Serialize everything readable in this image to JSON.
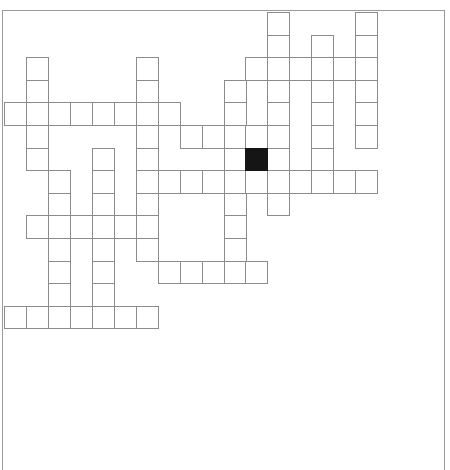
{
  "puzzle": {
    "title": "",
    "grid": {
      "rows": 14,
      "cols": 17,
      "cell_width_px": 21.95,
      "cell_height_px": 22.6,
      "origin_x": 4,
      "origin_y": 12,
      "cell_border_color": "#8c8c8c",
      "block_color": "#151515",
      "cells": [
        [
          0,
          12
        ],
        [
          0,
          16
        ],
        [
          1,
          12
        ],
        [
          1,
          14
        ],
        [
          1,
          16
        ],
        [
          2,
          1
        ],
        [
          2,
          6
        ],
        [
          2,
          11
        ],
        [
          2,
          12
        ],
        [
          2,
          13
        ],
        [
          2,
          14
        ],
        [
          2,
          15
        ],
        [
          2,
          16
        ],
        [
          3,
          1
        ],
        [
          3,
          6
        ],
        [
          3,
          10
        ],
        [
          3,
          12
        ],
        [
          3,
          14
        ],
        [
          3,
          16
        ],
        [
          4,
          0
        ],
        [
          4,
          1
        ],
        [
          4,
          2
        ],
        [
          4,
          3
        ],
        [
          4,
          4
        ],
        [
          4,
          5
        ],
        [
          4,
          6
        ],
        [
          4,
          7
        ],
        [
          4,
          10
        ],
        [
          4,
          12
        ],
        [
          4,
          14
        ],
        [
          4,
          16
        ],
        [
          5,
          1
        ],
        [
          5,
          6
        ],
        [
          5,
          8
        ],
        [
          5,
          9
        ],
        [
          5,
          10
        ],
        [
          5,
          11
        ],
        [
          5,
          12
        ],
        [
          5,
          14
        ],
        [
          5,
          16
        ],
        [
          6,
          1
        ],
        [
          6,
          4
        ],
        [
          6,
          6
        ],
        [
          6,
          10
        ],
        [
          6,
          12
        ],
        [
          6,
          14
        ],
        [
          7,
          2
        ],
        [
          7,
          4
        ],
        [
          7,
          6
        ],
        [
          7,
          7
        ],
        [
          7,
          8
        ],
        [
          7,
          9
        ],
        [
          7,
          10
        ],
        [
          7,
          11
        ],
        [
          7,
          12
        ],
        [
          7,
          13
        ],
        [
          7,
          14
        ],
        [
          7,
          15
        ],
        [
          7,
          16
        ],
        [
          8,
          2
        ],
        [
          8,
          4
        ],
        [
          8,
          6
        ],
        [
          8,
          10
        ],
        [
          8,
          12
        ],
        [
          9,
          1
        ],
        [
          9,
          2
        ],
        [
          9,
          3
        ],
        [
          9,
          4
        ],
        [
          9,
          5
        ],
        [
          9,
          6
        ],
        [
          9,
          10
        ],
        [
          10,
          2
        ],
        [
          10,
          4
        ],
        [
          10,
          6
        ],
        [
          10,
          10
        ],
        [
          11,
          2
        ],
        [
          11,
          4
        ],
        [
          11,
          7
        ],
        [
          11,
          8
        ],
        [
          11,
          9
        ],
        [
          11,
          10
        ],
        [
          11,
          11
        ],
        [
          12,
          2
        ],
        [
          12,
          4
        ],
        [
          13,
          0
        ],
        [
          13,
          1
        ],
        [
          13,
          2
        ],
        [
          13,
          3
        ],
        [
          13,
          4
        ],
        [
          13,
          5
        ],
        [
          13,
          6
        ]
      ],
      "blocks": [
        [
          6,
          11
        ]
      ]
    }
  }
}
